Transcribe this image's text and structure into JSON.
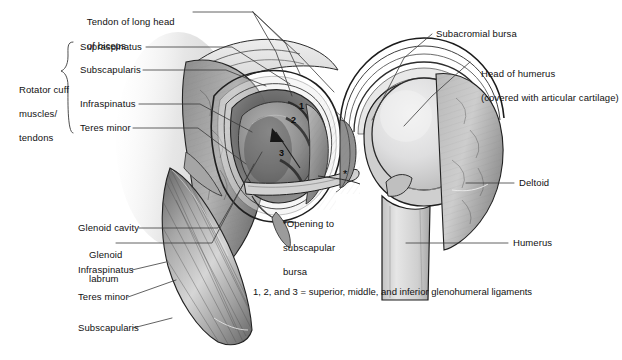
{
  "figure": {
    "background_color": "#ffffff",
    "line_color": "#333333",
    "text_color": "#111111"
  },
  "labels": {
    "left": [
      {
        "id": "tendon-long-head-biceps",
        "line1": "Tendon of long head",
        "line2": "of biceps"
      },
      {
        "id": "supraspinatus-top",
        "line1": "Supraspinatus",
        "line2": ""
      },
      {
        "id": "subscapularis-top",
        "line1": "Subscapularis",
        "line2": ""
      },
      {
        "id": "infraspinatus-top",
        "line1": "Infraspinatus",
        "line2": ""
      },
      {
        "id": "teres-minor-top",
        "line1": "Teres minor",
        "line2": ""
      },
      {
        "id": "glenoid-cavity",
        "line1": "Glenoid cavity",
        "line2": ""
      },
      {
        "id": "glenoid-labrum",
        "line1": "Glenoid",
        "line2": "labrum"
      },
      {
        "id": "infraspinatus-bottom",
        "line1": "Infraspinatus",
        "line2": ""
      },
      {
        "id": "teres-minor-bottom",
        "line1": "Teres minor",
        "line2": ""
      },
      {
        "id": "subscapularis-bottom",
        "line1": "Subscapularis",
        "line2": ""
      }
    ],
    "bracket_group": {
      "id": "rotator-cuff-group",
      "line1": "Rotator cuff",
      "line2": "muscles/",
      "line3": "tendons"
    },
    "right": [
      {
        "id": "subacromial-bursa",
        "line1": "Subacromial bursa",
        "line2": ""
      },
      {
        "id": "head-of-humerus",
        "line1": "Head of humerus",
        "line2": "(covered with articular cartilage)"
      },
      {
        "id": "deltoid",
        "line1": "Deltoid",
        "line2": ""
      },
      {
        "id": "humerus",
        "line1": "Humerus",
        "line2": ""
      }
    ],
    "center": {
      "id": "opening-subscapular-bursa",
      "line1": "*Opening to",
      "line2": "subscapular",
      "line3": "bursa"
    },
    "footnote": {
      "id": "ligament-key",
      "text": "1, 2, and 3 = superior, middle, and inferior glenohumeral ligaments"
    }
  },
  "markers": {
    "ligaments": [
      {
        "number": "1",
        "name": "superior glenohumeral ligament"
      },
      {
        "number": "2",
        "name": "middle glenohumeral ligament"
      },
      {
        "number": "3",
        "name": "inferior glenohumeral ligament"
      }
    ],
    "asterisk": "*"
  },
  "palette": {
    "tissue_mid": "#9a9a9a",
    "tissue_light": "#c9c9c9",
    "tissue_dark": "#5e5e5e",
    "bone_light": "#dcdcdc",
    "outline": "#1d1d1d",
    "capsule": "#b4b4b4",
    "shadow": "#6f6f6f"
  }
}
